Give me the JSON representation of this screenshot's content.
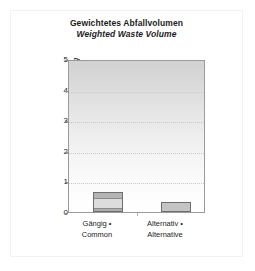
{
  "chart_data": {
    "type": "bar",
    "title": "Gewichtetes Abfallvolumen",
    "subtitle": "Weighted Waste Volume",
    "xlabel": "",
    "ylabel_de": "Bewertung",
    "ylabel_sep": " • ",
    "ylabel_en": "Rating",
    "categories": [
      "Gängig •\nCommon",
      "Alternativ •\nAlternative"
    ],
    "category_labels": [
      {
        "line1": "Gängig •",
        "line2": "Common"
      },
      {
        "line1": "Alternativ •",
        "line2": "Alternative"
      }
    ],
    "values": [
      0.65,
      0.33
    ],
    "ylim": [
      0,
      5
    ],
    "yticks": [
      0,
      1,
      2,
      3,
      4,
      5
    ],
    "ytick_labels": [
      "0",
      "1",
      "2",
      "3",
      "4",
      "5"
    ],
    "grid": true,
    "gridlines_at": [
      1,
      2,
      3,
      4
    ],
    "legend": null,
    "bar_color": "#c4c4c4",
    "bar_border_color": "#6e6e6e",
    "plot_bg_top": "#d2d2d2",
    "plot_bg_bottom": "#ffffff",
    "axis_color": "#9a9a9a",
    "text_color": "#1c1c1c"
  }
}
